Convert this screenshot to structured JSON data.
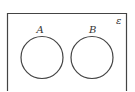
{
  "diagram": {
    "type": "venn",
    "universal_set": {
      "label": "ε"
    },
    "sets": [
      {
        "label": "A"
      },
      {
        "label": "B"
      }
    ],
    "relationship": "disjoint",
    "colors": {
      "stroke": "#444444",
      "background": "#ffffff"
    }
  }
}
